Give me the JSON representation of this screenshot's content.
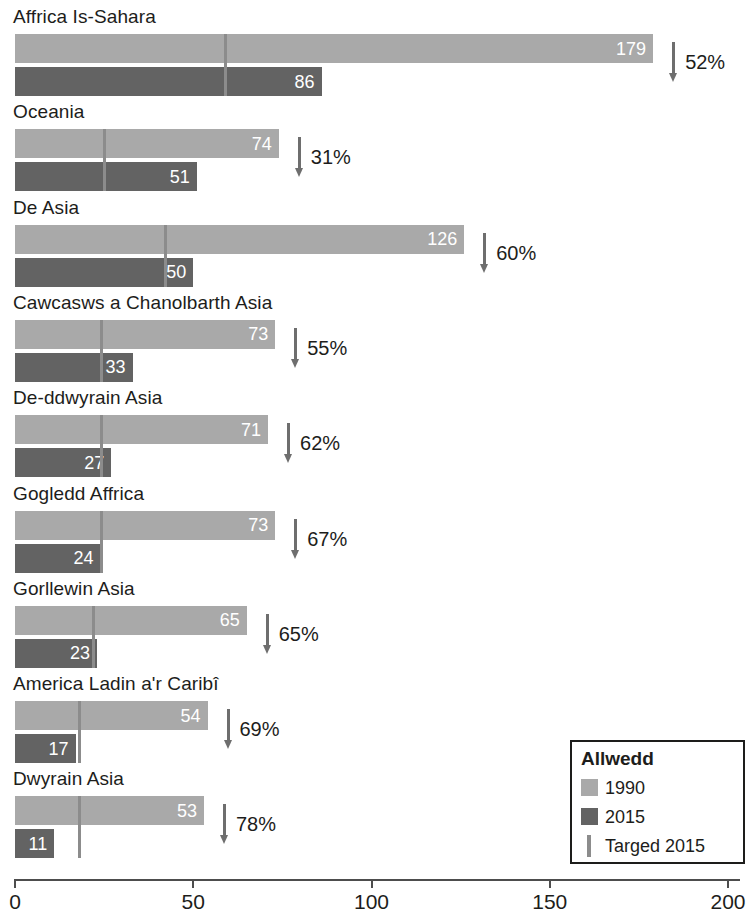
{
  "chart_data": {
    "type": "bar",
    "title": "",
    "subtitle": "",
    "xlabel": "",
    "ylabel": "",
    "orientation": "horizontal",
    "xlim": [
      0,
      200
    ],
    "xticks": [
      0,
      50,
      100,
      150,
      200
    ],
    "xtick_labels": [
      "0",
      "50",
      "100",
      "150",
      "200"
    ],
    "grid": false,
    "legend_position": "bottom-right",
    "categories": [
      "Affrica Is-Sahara",
      "Oceania",
      "De Asia",
      "Cawcasws a Chanolbarth Asia",
      "De-ddwyrain Asia",
      "Gogledd Affrica",
      "Gorllewin Asia",
      "America Ladin a'r Caribî",
      "Dwyrain Asia"
    ],
    "series": [
      {
        "name": "1990",
        "color": "#a9a9a9",
        "values": [
          179,
          74,
          126,
          73,
          71,
          73,
          65,
          54,
          53
        ]
      },
      {
        "name": "2015",
        "color": "#636363",
        "values": [
          86,
          51,
          50,
          33,
          27,
          24,
          23,
          17,
          11
        ]
      },
      {
        "name": "Targed 2015",
        "color": "#8c8c8c",
        "type": "marker",
        "values": [
          59,
          25,
          42,
          24,
          24,
          24,
          22,
          18,
          18
        ]
      }
    ],
    "annotations": [
      {
        "label": "52%",
        "icon": "down-arrow"
      },
      {
        "label": "31%",
        "icon": "down-arrow"
      },
      {
        "label": "60%",
        "icon": "down-arrow"
      },
      {
        "label": "55%",
        "icon": "down-arrow"
      },
      {
        "label": "62%",
        "icon": "down-arrow"
      },
      {
        "label": "67%",
        "icon": "down-arrow"
      },
      {
        "label": "65%",
        "icon": "down-arrow"
      },
      {
        "label": "69%",
        "icon": "down-arrow"
      },
      {
        "label": "78%",
        "icon": "down-arrow"
      }
    ]
  },
  "groups": [
    {
      "label": "Affrica Is-Sahara",
      "v1990": 179,
      "v1990_text": "179",
      "v2015": 86,
      "v2015_text": "86",
      "target": 59,
      "change_text": "52%"
    },
    {
      "label": "Oceania",
      "v1990": 74,
      "v1990_text": "74",
      "v2015": 51,
      "v2015_text": "51",
      "target": 25,
      "change_text": "31%"
    },
    {
      "label": "De Asia",
      "v1990": 126,
      "v1990_text": "126",
      "v2015": 50,
      "v2015_text": "50",
      "target": 42,
      "change_text": "60%"
    },
    {
      "label": "Cawcasws a Chanolbarth Asia",
      "v1990": 73,
      "v1990_text": "73",
      "v2015": 33,
      "v2015_text": "33",
      "target": 24,
      "change_text": "55%"
    },
    {
      "label": "De-ddwyrain Asia",
      "v1990": 71,
      "v1990_text": "71",
      "v2015": 27,
      "v2015_text": "27",
      "target": 24,
      "change_text": "62%"
    },
    {
      "label": "Gogledd Affrica",
      "v1990": 73,
      "v1990_text": "73",
      "v2015": 24,
      "v2015_text": "24",
      "target": 24,
      "change_text": "67%"
    },
    {
      "label": "Gorllewin Asia",
      "v1990": 65,
      "v1990_text": "65",
      "v2015": 23,
      "v2015_text": "23",
      "target": 22,
      "change_text": "65%"
    },
    {
      "label": "America Ladin a'r Caribî",
      "v1990": 54,
      "v1990_text": "54",
      "v2015": 17,
      "v2015_text": "17",
      "target": 18,
      "change_text": "69%"
    },
    {
      "label": "Dwyrain Asia",
      "v1990": 53,
      "v1990_text": "53",
      "v2015": 11,
      "v2015_text": "11",
      "target": 18,
      "change_text": "78%"
    }
  ],
  "axis": {
    "ticks": [
      {
        "value": 0,
        "label": "0"
      },
      {
        "value": 50,
        "label": "50"
      },
      {
        "value": 100,
        "label": "100"
      },
      {
        "value": 150,
        "label": "150"
      },
      {
        "value": 200,
        "label": "200"
      }
    ]
  },
  "legend": {
    "title": "Allwedd",
    "items": [
      {
        "label": "1990",
        "swatch": "sw-1990",
        "icon": "legend-swatch-1990"
      },
      {
        "label": "2015",
        "swatch": "sw-2015",
        "icon": "legend-swatch-2015"
      },
      {
        "label": "Targed 2015",
        "swatch": "sw-target",
        "icon": "legend-marker-target"
      }
    ]
  },
  "colors": {
    "series_1990": "#a9a9a9",
    "series_2015": "#636363",
    "target_marker": "#8c8c8c",
    "axis": "#4d4d4d",
    "text": "#1d1d1b",
    "background": "#ffffff"
  }
}
